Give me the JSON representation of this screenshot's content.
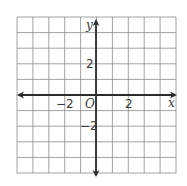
{
  "diagram": {
    "type": "coordinate-plane",
    "grid": {
      "columns": 10,
      "rows": 10,
      "left": 17,
      "top": 17,
      "right": 176,
      "bottom": 173,
      "line_color": "#8a8a8a",
      "border_color": "#8a8a8a"
    },
    "axes": {
      "origin_px": [
        96,
        95
      ],
      "color": "#2b2b2b",
      "x_axis_label": "x",
      "y_axis_label": "y",
      "origin_label": "O"
    },
    "tick_labels": {
      "x_neg": "−2",
      "x_pos": "2",
      "y_pos": "2",
      "y_neg": "−2"
    }
  }
}
